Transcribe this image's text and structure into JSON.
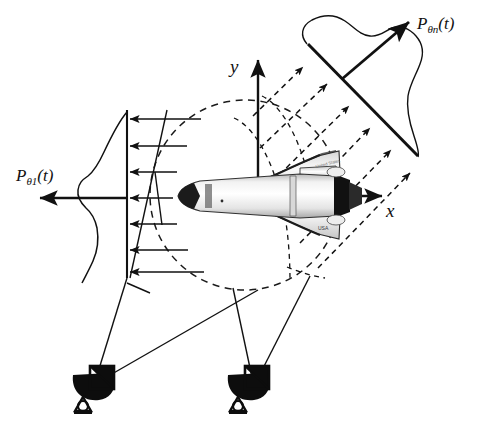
{
  "figure": {
    "axes": {
      "y_label": "y",
      "x_label": "x"
    },
    "projections": [
      {
        "id": "theta1",
        "label_P": "P",
        "label_sub": "θ1",
        "label_arg": "(t)",
        "orientation": "horizontal-left",
        "ray_count": 7,
        "detector_type": "vertical-line",
        "profile_shape": "double-peak"
      },
      {
        "id": "thetan",
        "label_P": "P",
        "label_sub": "θn",
        "label_arg": "(t)",
        "orientation": "diagonal-upper-right",
        "ray_count": 6,
        "detector_type": "diagonal-line",
        "profile_shape": "broad-plateau"
      }
    ],
    "target": {
      "name": "space-shuttle-orbiter",
      "view": "top-down",
      "marking": "USA"
    },
    "boundary": {
      "name": "reconstruction-circle",
      "style": "dashed",
      "center_x": 245,
      "center_y": 195,
      "radius": 95
    },
    "antennas": [
      {
        "id": "antenna-left",
        "name": "radar-dish-antenna",
        "x": 95,
        "y": 385
      },
      {
        "id": "antenna-right",
        "name": "radar-dish-antenna",
        "x": 250,
        "y": 385
      }
    ],
    "colors": {
      "ink": "#111111",
      "background": "#ffffff",
      "dashed": "#1a1a1a"
    },
    "caption": ""
  }
}
